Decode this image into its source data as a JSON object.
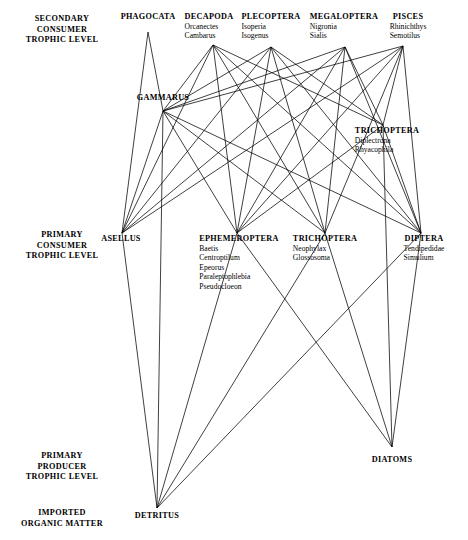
{
  "figure": {
    "stroke_color": "#000000",
    "background": "#ffffff"
  },
  "tier_labels": [
    {
      "id": "secondary-consumer",
      "lines": [
        "SECONDARY",
        "CONSUMER",
        "TROPHIC LEVEL"
      ],
      "x": 62,
      "y": 14
    },
    {
      "id": "primary-consumer",
      "lines": [
        "PRIMARY",
        "CONSUMER",
        "TROPHIC LEVEL"
      ],
      "x": 62,
      "y": 230
    },
    {
      "id": "primary-producer",
      "lines": [
        "PRIMARY",
        "PRODUCER",
        "TROPHIC LEVEL"
      ],
      "x": 62,
      "y": 451
    },
    {
      "id": "imported-organic",
      "lines": [
        "IMPORTED",
        "ORGANIC MATTER"
      ],
      "x": 62,
      "y": 508
    }
  ],
  "nodes": [
    {
      "id": "phagocata",
      "name": "PHAGOCATA",
      "genera": [],
      "vx": 148,
      "vy": 32,
      "lx": 148,
      "ly": 12,
      "align": "center"
    },
    {
      "id": "decapoda",
      "name": "DECAPODA",
      "genera": [
        "Orcanectes",
        "Cambarus"
      ],
      "vx": 213,
      "vy": 45,
      "lx": 209,
      "ly": 12,
      "align": "center"
    },
    {
      "id": "plecoptera",
      "name": "PLECOPTERA",
      "genera": [
        "Isoperia",
        "Isogenus"
      ],
      "vx": 271,
      "vy": 47,
      "lx": 271,
      "ly": 12,
      "align": "center"
    },
    {
      "id": "megaloptera",
      "name": "MEGALOPTERA",
      "genera": [
        "Nigronia",
        "Sialis"
      ],
      "vx": 345,
      "vy": 47,
      "lx": 344,
      "ly": 12,
      "align": "center"
    },
    {
      "id": "pisces",
      "name": "PISCES",
      "genera": [
        "Rhinichthys",
        "Semotilus"
      ],
      "vx": 403,
      "vy": 46,
      "lx": 408,
      "ly": 12,
      "align": "center"
    },
    {
      "id": "gammarus",
      "name": "GAMMARUS",
      "genera": [],
      "vx": 163,
      "vy": 111,
      "lx": 163,
      "ly": 93,
      "align": "center"
    },
    {
      "id": "trichoptera-up",
      "name": "TRICHOPTERA",
      "genera": [
        "Diplectrona",
        "Rhyacophila"
      ],
      "vx": 383,
      "vy": 125,
      "lx": 387,
      "ly": 126,
      "align": "center"
    },
    {
      "id": "asellus",
      "name": "ASELLUS",
      "genera": [],
      "vx": 122,
      "vy": 233,
      "lx": 121,
      "ly": 234,
      "align": "center"
    },
    {
      "id": "ephemeroptera",
      "name": "EPHEMEROPTERA",
      "genera": [
        "Baetis",
        "Centroptilum",
        "Epeorus",
        "Paraleptophlebia",
        "Pseudocloeon"
      ],
      "vx": 237,
      "vy": 233,
      "lx": 239,
      "ly": 234,
      "align": "center"
    },
    {
      "id": "trichoptera-lo",
      "name": "TRICHOPTERA",
      "genera": [
        "Neophylax",
        "Glossosoma"
      ],
      "vx": 325,
      "vy": 233,
      "lx": 325,
      "ly": 234,
      "align": "center"
    },
    {
      "id": "diptera",
      "name": "DIPTERA",
      "genera": [
        "Tendipedidae",
        "Simulium"
      ],
      "vx": 421,
      "vy": 233,
      "lx": 424,
      "ly": 234,
      "align": "center"
    },
    {
      "id": "diatoms",
      "name": "DIATOMS",
      "genera": [],
      "vx": 392,
      "vy": 447,
      "lx": 392,
      "ly": 455,
      "align": "center"
    },
    {
      "id": "detritus",
      "name": "DETRITUS",
      "genera": [],
      "vx": 157,
      "vy": 508,
      "lx": 157,
      "ly": 511,
      "align": "center"
    }
  ],
  "edges": [
    {
      "from": "phagocata",
      "to": "gammarus"
    },
    {
      "from": "phagocata",
      "to": "asellus"
    },
    {
      "from": "decapoda",
      "to": "gammarus"
    },
    {
      "from": "decapoda",
      "to": "asellus"
    },
    {
      "from": "decapoda",
      "to": "ephemeroptera"
    },
    {
      "from": "decapoda",
      "to": "trichoptera-lo"
    },
    {
      "from": "decapoda",
      "to": "diptera"
    },
    {
      "from": "decapoda",
      "to": "trichoptera-up"
    },
    {
      "from": "plecoptera",
      "to": "gammarus"
    },
    {
      "from": "plecoptera",
      "to": "asellus"
    },
    {
      "from": "plecoptera",
      "to": "ephemeroptera"
    },
    {
      "from": "plecoptera",
      "to": "trichoptera-lo"
    },
    {
      "from": "plecoptera",
      "to": "diptera"
    },
    {
      "from": "plecoptera",
      "to": "trichoptera-up"
    },
    {
      "from": "megaloptera",
      "to": "gammarus"
    },
    {
      "from": "megaloptera",
      "to": "asellus"
    },
    {
      "from": "megaloptera",
      "to": "ephemeroptera"
    },
    {
      "from": "megaloptera",
      "to": "trichoptera-lo"
    },
    {
      "from": "megaloptera",
      "to": "diptera"
    },
    {
      "from": "megaloptera",
      "to": "trichoptera-up"
    },
    {
      "from": "pisces",
      "to": "gammarus"
    },
    {
      "from": "pisces",
      "to": "asellus"
    },
    {
      "from": "pisces",
      "to": "ephemeroptera"
    },
    {
      "from": "pisces",
      "to": "trichoptera-lo"
    },
    {
      "from": "pisces",
      "to": "diptera"
    },
    {
      "from": "pisces",
      "to": "trichoptera-up"
    },
    {
      "from": "gammarus",
      "to": "asellus"
    },
    {
      "from": "gammarus",
      "to": "ephemeroptera"
    },
    {
      "from": "gammarus",
      "to": "trichoptera-lo"
    },
    {
      "from": "gammarus",
      "to": "diptera"
    },
    {
      "from": "gammarus",
      "to": "detritus"
    },
    {
      "from": "trichoptera-up",
      "to": "ephemeroptera"
    },
    {
      "from": "trichoptera-up",
      "to": "diptera"
    },
    {
      "from": "trichoptera-up",
      "to": "diatoms"
    },
    {
      "from": "asellus",
      "to": "detritus"
    },
    {
      "from": "ephemeroptera",
      "to": "detritus"
    },
    {
      "from": "ephemeroptera",
      "to": "diatoms"
    },
    {
      "from": "trichoptera-lo",
      "to": "detritus"
    },
    {
      "from": "trichoptera-lo",
      "to": "diatoms"
    },
    {
      "from": "diptera",
      "to": "detritus"
    },
    {
      "from": "diptera",
      "to": "diatoms"
    }
  ]
}
